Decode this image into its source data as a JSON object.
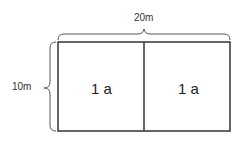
{
  "diagram": {
    "width_label": "20m",
    "height_label": "10m",
    "cells": [
      {
        "label": "1 a"
      },
      {
        "label": "1 a"
      }
    ],
    "colors": {
      "stroke": "#333333",
      "brace": "#555555"
    }
  }
}
